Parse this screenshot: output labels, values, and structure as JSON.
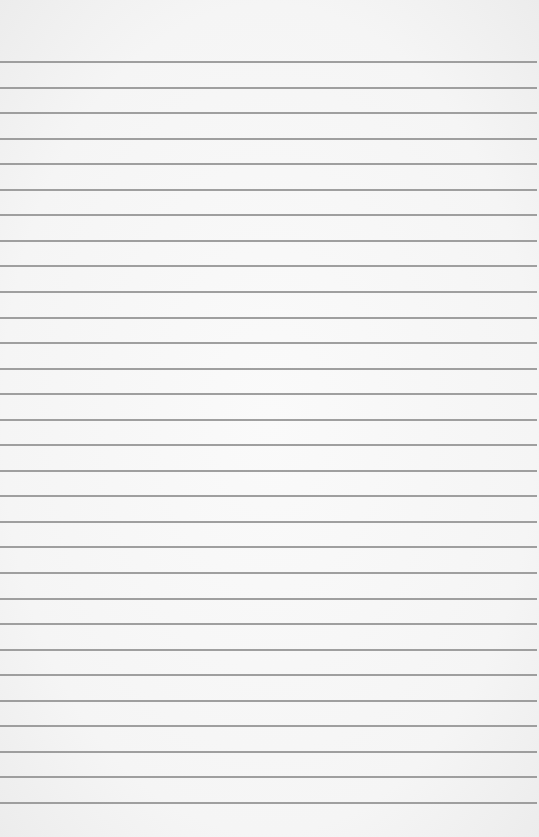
{
  "paper": {
    "type": "lined",
    "background_color": "#f5f5f5",
    "line_color": "#8f8f8f",
    "line_count": 30,
    "first_line_y": 61,
    "line_spacing": 25.55,
    "text": []
  }
}
